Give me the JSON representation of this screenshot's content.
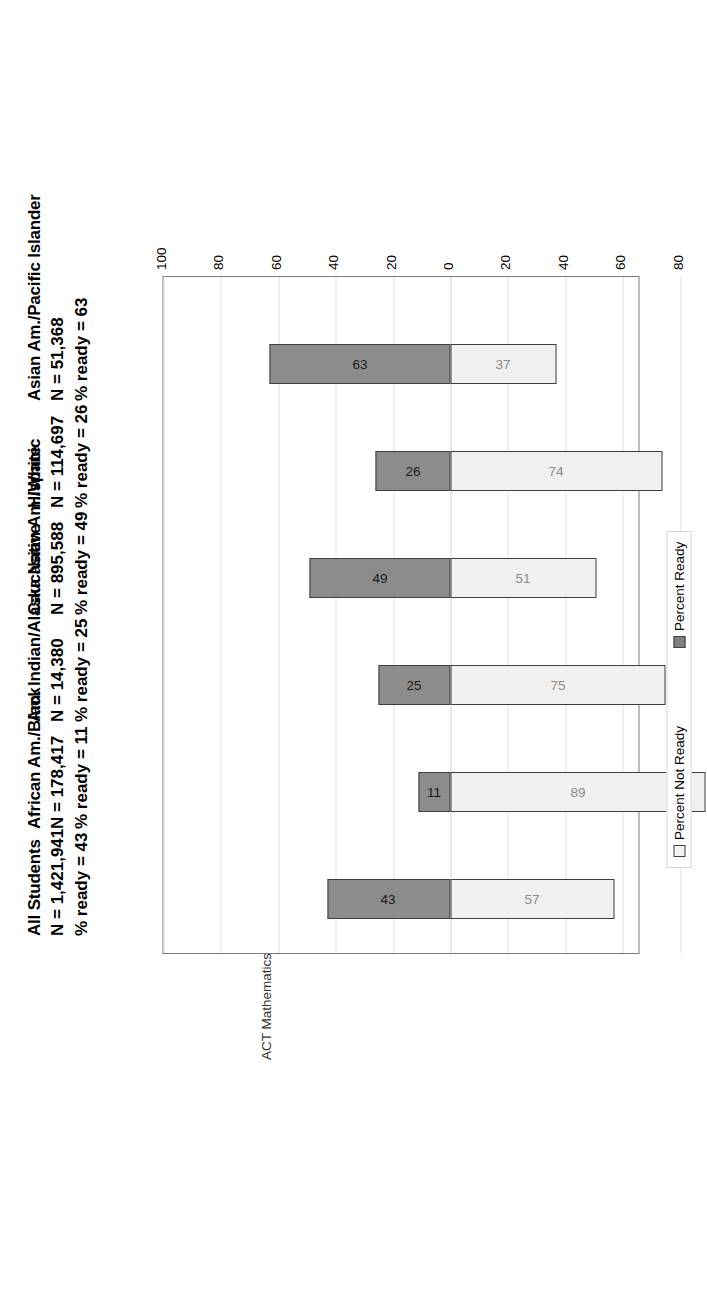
{
  "chart_data": {
    "type": "bar",
    "title": "ACT Mathematics Benchmark Score =",
    "benchmark_score": "22",
    "subtype": "diverging-stacked-bar",
    "orientation": "vertical-bars-rotated-page",
    "categories": [
      "All Students",
      "African Am./Black",
      "Am. Indian/Alaska Native",
      "Caucasian Am./White",
      "Hispanic",
      "Asian Am./Pacific Islander"
    ],
    "series": [
      {
        "name": "Percent Ready",
        "values": [
          43,
          11,
          25,
          49,
          26,
          63
        ]
      },
      {
        "name": "Percent Not Ready",
        "values": [
          57,
          89,
          75,
          51,
          74,
          37
        ]
      }
    ],
    "group_n": [
      "1,421,941",
      "178,417",
      "14,380",
      "895,588",
      "114,697",
      "51,368"
    ],
    "group_pct_ready": [
      "43",
      "11",
      "25",
      "49",
      "26",
      "63"
    ],
    "axis_ticks": [
      100,
      80,
      60,
      40,
      20,
      0,
      20,
      40,
      60,
      80,
      100
    ],
    "axis_tick_labels": [
      "100",
      "80",
      "60",
      "40",
      "20",
      "0",
      "20",
      "40",
      "60",
      "80",
      "100"
    ],
    "ylim": [
      -100,
      100
    ],
    "grid": true,
    "legend_position": "bottom",
    "xlabel": "",
    "ylabel": ""
  },
  "groups": [
    {
      "name": "All Students",
      "n_label": "N =",
      "n": "1,421,941",
      "ready_label": "% ready =",
      "ready": "43"
    },
    {
      "name": "African Am./Black",
      "n_label": "N =",
      "n": "178,417",
      "ready_label": "% ready =",
      "ready": "11"
    },
    {
      "name": "Am. Indian/Alaska Native",
      "n_label": "N =",
      "n": "14,380",
      "ready_label": "% ready =",
      "ready": "25"
    },
    {
      "name": "Caucasian Am./White",
      "n_label": "N =",
      "n": "895,588",
      "ready_label": "% ready =",
      "ready": "49"
    },
    {
      "name": "Hispanic",
      "n_label": "N =",
      "n": "114,697",
      "ready_label": "% ready =",
      "ready": "26"
    },
    {
      "name": "Asian Am./Pacific Islander",
      "n_label": "N =",
      "n": "51,368",
      "ready_label": "% ready =",
      "ready": "63"
    }
  ],
  "title": {
    "text": "ACT Mathematics Benchmark Score =",
    "score": "22"
  },
  "legend": {
    "items": [
      {
        "label": "Percent Not Ready",
        "swatch": "notready",
        "color": "#f2f2f2"
      },
      {
        "label": "Percent Ready",
        "swatch": "ready",
        "color": "#7f7f7f"
      }
    ]
  },
  "bar_values": {
    "ready": [
      "43",
      "11",
      "25",
      "49",
      "26",
      "63"
    ],
    "not_ready": [
      "57",
      "89",
      "75",
      "51",
      "74",
      "37"
    ]
  },
  "colors": {
    "ready": "#8c8c8c",
    "not_ready": "#f0f0f0",
    "outline": "#3f3f3f",
    "grid": "#e2e2e2",
    "frame": "#7b7b7b",
    "highlight": "#a6a6a6"
  }
}
